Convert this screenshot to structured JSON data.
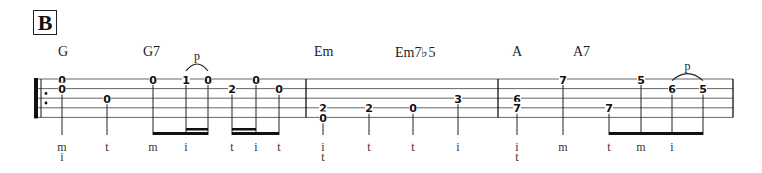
{
  "section_label": "B",
  "chords": [
    {
      "name": "G",
      "measure": 0,
      "beat_note": 0
    },
    {
      "name": "G7",
      "measure": 0,
      "beat_note": 2
    },
    {
      "name": "Em",
      "measure": 1,
      "beat_note": 0
    },
    {
      "name": "Em7♭5",
      "measure": 1,
      "beat_note": 2
    },
    {
      "name": "A",
      "measure": 2,
      "beat_note": 0
    },
    {
      "name": "A7",
      "measure": 2,
      "beat_note": 2
    }
  ],
  "staff": {
    "strings": 5,
    "repeat_start": true,
    "measures": 3
  },
  "measures": [
    {
      "notes": [
        {
          "frets": [
            {
              "string": 1,
              "fret": "0"
            },
            {
              "string": 2,
              "fret": "0"
            }
          ],
          "finger": [
            "m",
            "i"
          ],
          "duration": "quarter"
        },
        {
          "frets": [
            {
              "string": 3,
              "fret": "0"
            }
          ],
          "finger": [
            "t"
          ],
          "duration": "quarter"
        },
        {
          "frets": [
            {
              "string": 1,
              "fret": "0"
            }
          ],
          "finger": [
            "m"
          ],
          "duration": "eighth",
          "beam_group": 1
        },
        {
          "frets": [
            {
              "string": 1,
              "fret": "1"
            }
          ],
          "finger": [
            "i"
          ],
          "duration": "sixteenth",
          "beam_group": 1,
          "pull_off_start": true
        },
        {
          "frets": [
            {
              "string": 1,
              "fret": "0"
            }
          ],
          "finger": [],
          "duration": "sixteenth",
          "beam_group": 1,
          "pull_off_end": true
        },
        {
          "frets": [
            {
              "string": 2,
              "fret": "2"
            }
          ],
          "finger": [
            "t"
          ],
          "duration": "sixteenth",
          "beam_group": 2
        },
        {
          "frets": [
            {
              "string": 1,
              "fret": "0"
            }
          ],
          "finger": [
            "i"
          ],
          "duration": "sixteenth",
          "beam_group": 2
        },
        {
          "frets": [
            {
              "string": 2,
              "fret": "0"
            }
          ],
          "finger": [
            "t"
          ],
          "duration": "eighth",
          "beam_group": 2
        }
      ],
      "pull_off_label": "p"
    },
    {
      "notes": [
        {
          "frets": [
            {
              "string": 4,
              "fret": "2"
            },
            {
              "string": 5,
              "fret": "0"
            }
          ],
          "finger": [
            "i",
            "t"
          ],
          "duration": "quarter"
        },
        {
          "frets": [
            {
              "string": 4,
              "fret": "2"
            }
          ],
          "finger": [
            "t"
          ],
          "duration": "quarter"
        },
        {
          "frets": [
            {
              "string": 4,
              "fret": "0"
            }
          ],
          "finger": [
            "t"
          ],
          "duration": "quarter"
        },
        {
          "frets": [
            {
              "string": 3,
              "fret": "3"
            }
          ],
          "finger": [
            "i"
          ],
          "duration": "quarter"
        }
      ]
    },
    {
      "notes": [
        {
          "frets": [
            {
              "string": 3,
              "fret": "6"
            },
            {
              "string": 4,
              "fret": "7"
            }
          ],
          "finger": [
            "i",
            "t"
          ],
          "duration": "quarter"
        },
        {
          "frets": [
            {
              "string": 1,
              "fret": "7"
            }
          ],
          "finger": [
            "m"
          ],
          "duration": "quarter"
        },
        {
          "frets": [
            {
              "string": 4,
              "fret": "7"
            }
          ],
          "finger": [
            "t"
          ],
          "duration": "eighth",
          "beam_group": 3
        },
        {
          "frets": [
            {
              "string": 1,
              "fret": "5"
            }
          ],
          "finger": [
            "m"
          ],
          "duration": "eighth",
          "beam_group": 3
        },
        {
          "frets": [
            {
              "string": 2,
              "fret": "6"
            }
          ],
          "finger": [
            "i"
          ],
          "duration": "eighth",
          "beam_group": 3,
          "pull_off_start": true
        },
        {
          "frets": [
            {
              "string": 2,
              "fret": "5"
            }
          ],
          "finger": [],
          "duration": "eighth",
          "beam_group": 3,
          "pull_off_end": true
        }
      ],
      "pull_off_label": "p"
    }
  ]
}
